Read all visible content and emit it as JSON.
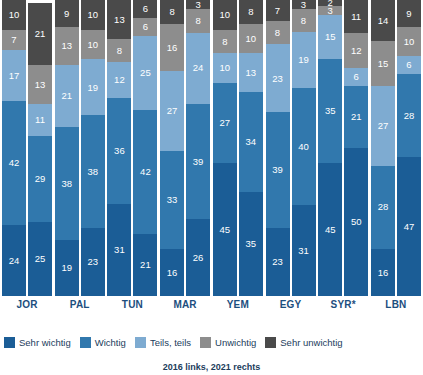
{
  "chart_data": {
    "type": "bar",
    "subtype": "stacked-bar-100-percent",
    "title": "",
    "xlabel": "",
    "ylabel": "",
    "ylim": [
      0,
      100
    ],
    "grid": false,
    "legend_position": "bottom",
    "orientation": "vertical",
    "stack_order_bottom_to_top": [
      "Sehr wichtig",
      "Wichtig",
      "Teils, teils",
      "Unwichtig",
      "Sehr unwichtig"
    ],
    "categories": [
      "JOR",
      "PAL",
      "TUN",
      "MAR",
      "YEM",
      "EGY",
      "SYR*",
      "LBN"
    ],
    "groups": [
      "2016",
      "2021"
    ],
    "series": [
      {
        "name": "Sehr wichtig",
        "color": "#1b5d96",
        "values_2016": [
          24,
          19,
          31,
          16,
          45,
          23,
          45,
          16
        ],
        "values_2021": [
          25,
          23,
          21,
          26,
          35,
          31,
          50,
          47
        ]
      },
      {
        "name": "Wichtig",
        "color": "#3178ad",
        "values_2016": [
          42,
          38,
          36,
          33,
          27,
          39,
          35,
          28
        ],
        "values_2021": [
          29,
          38,
          42,
          39,
          34,
          40,
          21,
          28
        ]
      },
      {
        "name": "Teils, teils",
        "color": "#7eabd1",
        "values_2016": [
          17,
          21,
          12,
          27,
          10,
          23,
          15,
          27
        ],
        "values_2021": [
          11,
          19,
          25,
          24,
          13,
          19,
          6,
          6
        ]
      },
      {
        "name": "Unwichtig",
        "color": "#8d8d8d",
        "values_2016": [
          7,
          13,
          8,
          16,
          8,
          8,
          3,
          15
        ],
        "values_2021": [
          13,
          10,
          6,
          8,
          10,
          8,
          12,
          10
        ]
      },
      {
        "name": "Sehr unwichtig",
        "color": "#4a4a4a",
        "values_2016": [
          10,
          9,
          13,
          8,
          10,
          7,
          2,
          14
        ],
        "values_2021": [
          21,
          10,
          6,
          3,
          8,
          3,
          11,
          9
        ]
      }
    ],
    "annotations": [
      "2016 links, 2021 rechts"
    ]
  },
  "legend": {
    "items": [
      {
        "label": "Sehr wichtig",
        "color": "#1b5d96"
      },
      {
        "label": "Wichtig",
        "color": "#3178ad"
      },
      {
        "label": "Teils, teils",
        "color": "#7eabd1"
      },
      {
        "label": "Unwichtig",
        "color": "#8d8d8d"
      },
      {
        "label": "Sehr unwichtig",
        "color": "#4a4a4a"
      }
    ]
  },
  "footnote": {
    "text": "2016 links, 2021 rechts"
  }
}
